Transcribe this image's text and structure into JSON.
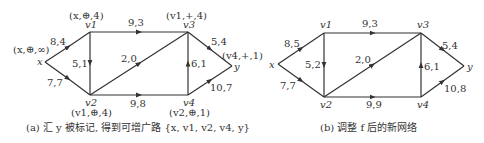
{
  "diagrams": [
    {
      "id": "a",
      "caption": "(a) 汇 y 被标记, 得到可增广路 {x, v1, v2, v4, y}",
      "nodes": {
        "x": {
          "label": "x",
          "mark": "(x,⊕,∞)"
        },
        "v1": {
          "label": "v1",
          "mark": "(x,⊕,4)"
        },
        "v2": {
          "label": "v2",
          "mark": "(v1,⊕,4)"
        },
        "v3": {
          "label": "v3",
          "mark": "(v1,+,4)"
        },
        "v4": {
          "label": "v4",
          "mark": "(v2,⊕,1)"
        },
        "y": {
          "label": "y",
          "mark": "(v4,+,1)"
        }
      },
      "edges": [
        {
          "from": "x",
          "to": "v1",
          "label": "8,4"
        },
        {
          "from": "x",
          "to": "v2",
          "label": "7,7"
        },
        {
          "from": "v1",
          "to": "v2",
          "label": "5,1"
        },
        {
          "from": "v1",
          "to": "v3",
          "label": "9,3"
        },
        {
          "from": "v2",
          "to": "v3",
          "label": "2,0"
        },
        {
          "from": "v2",
          "to": "v4",
          "label": "9,8"
        },
        {
          "from": "v4",
          "to": "v3",
          "label": "6,1"
        },
        {
          "from": "v3",
          "to": "y",
          "label": "5,4"
        },
        {
          "from": "v4",
          "to": "y",
          "label": "10,7"
        }
      ]
    },
    {
      "id": "b",
      "caption": "(b) 调整 f 后的新网络",
      "nodes": {
        "x": {
          "label": "x"
        },
        "v1": {
          "label": "v1"
        },
        "v2": {
          "label": "v2"
        },
        "v3": {
          "label": "v3"
        },
        "v4": {
          "label": "v4"
        },
        "y": {
          "label": "y"
        }
      },
      "edges": [
        {
          "from": "x",
          "to": "v1",
          "label": "8,5"
        },
        {
          "from": "x",
          "to": "v2",
          "label": "7,7"
        },
        {
          "from": "v1",
          "to": "v2",
          "label": "5,2"
        },
        {
          "from": "v1",
          "to": "v3",
          "label": "9,3"
        },
        {
          "from": "v2",
          "to": "v3",
          "label": "2,0"
        },
        {
          "from": "v2",
          "to": "v4",
          "label": "9,9"
        },
        {
          "from": "v4",
          "to": "v3",
          "label": "6,1"
        },
        {
          "from": "v3",
          "to": "y",
          "label": "5,4"
        },
        {
          "from": "v4",
          "to": "y",
          "label": "10,8"
        }
      ]
    }
  ]
}
